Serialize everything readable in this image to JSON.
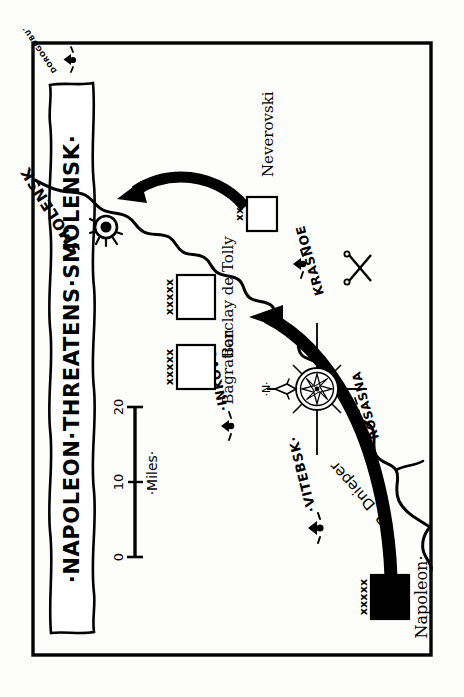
{
  "map": {
    "title": "·NAPOLEON·THREATENS·SMOLENSK·",
    "border_color": "#000000",
    "background_color": "#fdfdfc",
    "ink_color": "#000000",
    "orientation_note": "rotated",
    "scale": {
      "label": "·Miles·",
      "ticks": [
        "0",
        "10",
        "20"
      ],
      "units": "Miles",
      "max": 20
    },
    "compass": {
      "name": "compass-rose",
      "north_label": "·N·"
    },
    "river": {
      "label": "R. Dnieper"
    },
    "cities": [
      {
        "name": "SMOLENSK",
        "symbol": "walled-city"
      },
      {
        "name": "·VITEBSK·",
        "symbol": "town"
      },
      {
        "name": "·INKOVO·",
        "symbol": "town"
      },
      {
        "name": "KRASNOE",
        "symbol": "town"
      },
      {
        "name": "ROSASNA",
        "symbol": "town"
      },
      {
        "name": "DOROGOBUZH",
        "symbol": "town"
      }
    ],
    "units": [
      {
        "commander": "Napoleon·",
        "echelon": "xxxxx",
        "affiliation": "french",
        "fill": "solid"
      },
      {
        "commander": "Bagration",
        "echelon": "xxxxx",
        "affiliation": "russian",
        "fill": "open"
      },
      {
        "commander": "Barclay de Tolly",
        "echelon": "xxxxx",
        "affiliation": "russian",
        "fill": "open"
      },
      {
        "commander": "Neverovski",
        "echelon": "xx",
        "affiliation": "russian",
        "fill": "open"
      }
    ],
    "battle": {
      "name": "battle-symbol",
      "glyph": "crossed-swords"
    },
    "arrows": [
      {
        "name": "french-advance-arrow",
        "from": "Napoleon",
        "to": "Krasnoe"
      },
      {
        "name": "neverovski-retreat-arrow",
        "from": "Neverovski",
        "to": "Smolensk"
      }
    ]
  }
}
